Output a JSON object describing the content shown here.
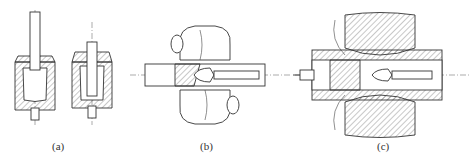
{
  "figure": {
    "panels": [
      {
        "id": "a",
        "caption": "(a)",
        "description": "Two cup-forming dies in section with punch (hatched die, punch, ejector pin)"
      },
      {
        "id": "b",
        "caption": "(b)",
        "description": "Two rolls piercing a round bar over a mandrel/plug, with rotation arrows"
      },
      {
        "id": "c",
        "caption": "(c)",
        "description": "Cross-section of rolls with pierced workpiece, plug on mandrel, push arrow from left"
      }
    ],
    "colors": {
      "line": "#333333",
      "background": "#ffffff"
    }
  }
}
